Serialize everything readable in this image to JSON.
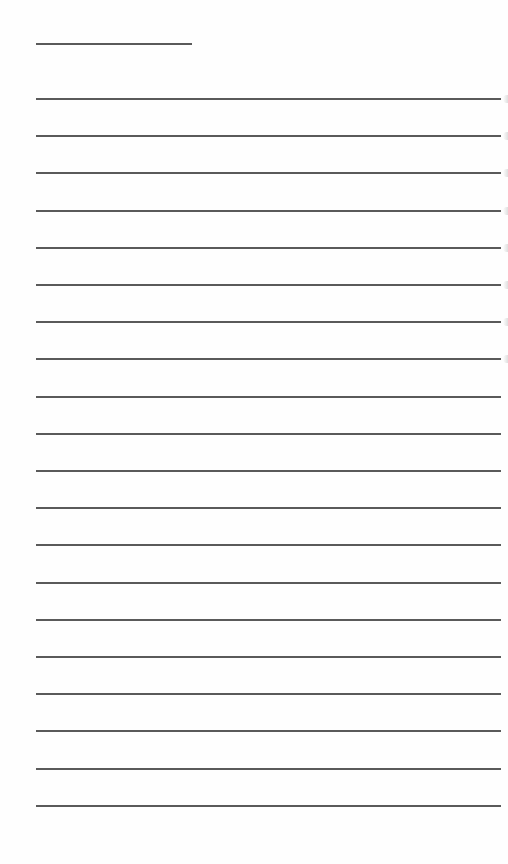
{
  "document": {
    "type": "blank lined writing sheet",
    "title_line": {
      "x_start": 36,
      "x_end": 192,
      "y": 44
    },
    "ruled_lines": {
      "count": 20,
      "x_start": 36,
      "x_end": 501,
      "y_positions": [
        99,
        136,
        173,
        211,
        248,
        285,
        322,
        359,
        397,
        434,
        471,
        508,
        545,
        583,
        620,
        657,
        694,
        731,
        769,
        806
      ]
    },
    "line_color": "#5a5a5a",
    "background_color": "#ffffff",
    "edge_marks_y": [
      99,
      136,
      173,
      211,
      248,
      285,
      322,
      359
    ]
  }
}
